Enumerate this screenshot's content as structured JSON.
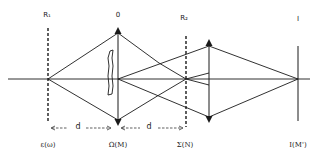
{
  "diagram": {
    "type": "optical ray diagram",
    "top_labels": {
      "r1": "R₁",
      "o": "0",
      "r2": "R₂",
      "i": "I"
    },
    "bottom_labels": {
      "epsilon": "ε(ω)",
      "omega": "Ω(M)",
      "sigma": "Σ(N)",
      "image": "I(M')"
    },
    "distance_labels": {
      "d1": "d",
      "d2": "d"
    },
    "arrows": {
      "d1_left": "<---",
      "d1_right": "--->",
      "d2_left": "<---",
      "d2_right": "--->"
    },
    "colors": {
      "line": "#1a1a1a",
      "background": "#ffffff"
    }
  }
}
